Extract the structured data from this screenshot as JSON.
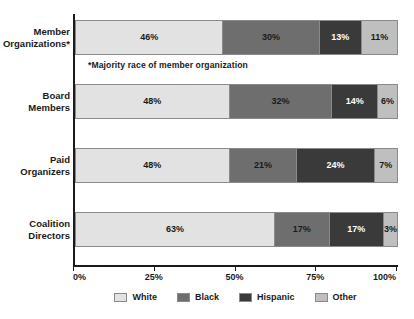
{
  "chart_data": {
    "type": "bar",
    "orientation": "horizontal",
    "stacked": true,
    "normalized_percent": true,
    "title": "",
    "subtitle": "",
    "xlabel": "",
    "ylabel": "",
    "xlim": [
      0,
      100
    ],
    "grid": false,
    "legend_position": "bottom",
    "annotation": "*Majority race of member organization",
    "categories": [
      "Member Organizations*",
      "Board Members",
      "Paid Organizers",
      "Coalition Directors"
    ],
    "category_lines": [
      [
        "Member",
        "Organizations*"
      ],
      [
        "Board",
        "Members"
      ],
      [
        "Paid",
        "Organizers"
      ],
      [
        "Coalition",
        "Directors"
      ]
    ],
    "series": [
      {
        "name": "White",
        "color": "#e2e2e2",
        "label_color": "dark",
        "values": [
          46,
          48,
          48,
          63
        ]
      },
      {
        "name": "Black",
        "color": "#6e6e6e",
        "label_color": "dark",
        "values": [
          30,
          32,
          21,
          17
        ]
      },
      {
        "name": "Hispanic",
        "color": "#3a3a3a",
        "label_color": "light",
        "values": [
          13,
          14,
          24,
          17
        ]
      },
      {
        "name": "Other",
        "color": "#bfbfbf",
        "label_color": "dark",
        "values": [
          11,
          6,
          7,
          3
        ]
      }
    ],
    "value_labels": [
      [
        "46%",
        "30%",
        "13%",
        "11%"
      ],
      [
        "48%",
        "32%",
        "14%",
        "6%"
      ],
      [
        "48%",
        "21%",
        "24%",
        "7%"
      ],
      [
        "63%",
        "17%",
        "17%",
        "3%"
      ]
    ],
    "xticks": [
      0,
      25,
      50,
      75,
      100
    ],
    "xtick_labels": [
      "0%",
      "25%",
      "50%",
      "75%",
      "100%"
    ]
  },
  "legend": {
    "items": [
      {
        "label": "White",
        "color": "#e2e2e2"
      },
      {
        "label": "Black",
        "color": "#6e6e6e"
      },
      {
        "label": "Hispanic",
        "color": "#3a3a3a"
      },
      {
        "label": "Other",
        "color": "#bfbfbf"
      }
    ]
  },
  "axis": {
    "tick_labels": [
      "0%",
      "25%",
      "50%",
      "75%",
      "100%"
    ]
  },
  "footnote": {
    "text": "*Majority race of member organization"
  }
}
